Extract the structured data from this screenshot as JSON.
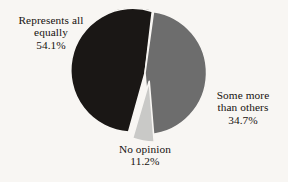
{
  "chart_data": {
    "type": "pie",
    "title": "",
    "subtitle": "",
    "xlabel": "",
    "ylabel": "",
    "legend_position": "none",
    "grid": false,
    "labels_inline": true,
    "categories": [
      "Represents all equally",
      "Some more than others",
      "No opinion"
    ],
    "values": [
      54.1,
      34.7,
      11.2
    ],
    "value_suffix": "%",
    "colors": [
      "#1a1715",
      "#6d6d6d",
      "#c9c9c7"
    ],
    "exploded": [
      "No opinion"
    ],
    "slices": [
      {
        "name": "Represents all equally",
        "value": 54.1,
        "value_text": "54.1%",
        "color": "#1a1715",
        "exploded": false,
        "label_lines": [
          "Represents all",
          "equally",
          "54.1%"
        ]
      },
      {
        "name": "Some more than others",
        "value": 34.7,
        "value_text": "34.7%",
        "color": "#6d6d6d",
        "exploded": false,
        "label_lines": [
          "Some more",
          "than others",
          "34.7%"
        ]
      },
      {
        "name": "No opinion",
        "value": 11.2,
        "value_text": "11.2%",
        "color": "#c9c9c7",
        "exploded": true,
        "label_lines": [
          "No opinion",
          "11.2%"
        ]
      }
    ]
  },
  "style": {
    "background_color": "#f8f6f3",
    "text_color": "#17120f",
    "slice_outline_color": "#f8f6f3"
  },
  "labels": {
    "represents": {
      "line1": "Represents all",
      "line2": "equally",
      "line3": "54.1%"
    },
    "some_more": {
      "line1": "Some more",
      "line2": "than others",
      "line3": "34.7%"
    },
    "no_opinion": {
      "line1": "No opinion",
      "line2": "11.2%"
    }
  }
}
